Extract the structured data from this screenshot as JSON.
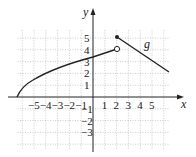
{
  "graph": {
    "function_name": "g",
    "x_axis_label": "x",
    "y_axis_label": "y",
    "x_ticks": [
      "−5",
      "−4",
      "−3",
      "−2",
      "−1",
      "1",
      "2",
      "3",
      "4",
      "5"
    ],
    "x_tick_values": [
      -5,
      -4,
      -3,
      -2,
      -1,
      1,
      2,
      3,
      4,
      5
    ],
    "y_ticks": [
      "5",
      "4",
      "3",
      "2",
      "1",
      "−1",
      "−2",
      "−3"
    ],
    "y_tick_values": [
      5,
      4,
      3,
      2,
      1,
      -1,
      -2,
      -3
    ],
    "colors": {
      "curve": "#222222",
      "grid": "#aaaaaa",
      "axis": "#222222"
    }
  },
  "chart_data": {
    "type": "line",
    "title": "",
    "xlabel": "x",
    "ylabel": "y",
    "xlim": [
      -6.5,
      6.5
    ],
    "ylim": [
      -4.5,
      6
    ],
    "grid": true,
    "series": [
      {
        "name": "g (left piece, square-root curve)",
        "points": [
          [
            -6.5,
            0
          ],
          [
            -5,
            1.55
          ],
          [
            -3,
            2.4
          ],
          [
            -1,
            3.1
          ],
          [
            0,
            3.3
          ],
          [
            1,
            3.65
          ],
          [
            2,
            4
          ]
        ],
        "end": "open circle at (2,4)"
      },
      {
        "name": "g (right piece, line)",
        "points": [
          [
            2,
            5
          ],
          [
            6.3,
            2.1
          ]
        ],
        "start": "closed dot at (2,5)"
      }
    ],
    "annotations": [
      {
        "text": "g",
        "x": 4.2,
        "y": 4.2
      }
    ]
  }
}
